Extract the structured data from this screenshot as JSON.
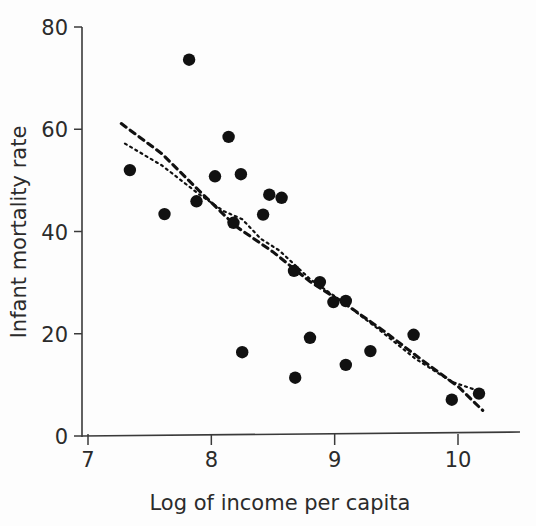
{
  "chart_data": {
    "type": "scatter",
    "title": "",
    "xlabel": "Log of income per capita",
    "ylabel": "Infant mortality rate",
    "xlim": [
      6.85,
      10.35
    ],
    "ylim": [
      0,
      82
    ],
    "xticks": [
      7,
      8,
      9,
      10
    ],
    "xtick_labels": [
      "7",
      "8",
      "9",
      "10"
    ],
    "yticks": [
      0,
      20,
      40,
      60,
      80
    ],
    "ytick_labels": [
      "0",
      "20",
      "40",
      "60",
      "80"
    ],
    "grid": false,
    "legend": "none",
    "points": [
      {
        "x": 7.34,
        "y": 52.0
      },
      {
        "x": 7.62,
        "y": 43.4
      },
      {
        "x": 7.82,
        "y": 73.6
      },
      {
        "x": 7.88,
        "y": 45.9
      },
      {
        "x": 8.03,
        "y": 50.8
      },
      {
        "x": 8.14,
        "y": 58.5
      },
      {
        "x": 8.18,
        "y": 41.7
      },
      {
        "x": 8.24,
        "y": 51.2
      },
      {
        "x": 8.25,
        "y": 16.4
      },
      {
        "x": 8.42,
        "y": 43.3
      },
      {
        "x": 8.47,
        "y": 47.2
      },
      {
        "x": 8.57,
        "y": 46.6
      },
      {
        "x": 8.67,
        "y": 32.3
      },
      {
        "x": 8.68,
        "y": 11.4
      },
      {
        "x": 8.8,
        "y": 19.2
      },
      {
        "x": 8.88,
        "y": 30.1
      },
      {
        "x": 8.99,
        "y": 26.2
      },
      {
        "x": 9.09,
        "y": 26.4
      },
      {
        "x": 9.09,
        "y": 13.9
      },
      {
        "x": 9.29,
        "y": 16.6
      },
      {
        "x": 9.64,
        "y": 19.8
      },
      {
        "x": 9.95,
        "y": 7.1
      },
      {
        "x": 10.17,
        "y": 8.3
      }
    ],
    "series": [
      {
        "name": "dashed-fit",
        "style": "dashed",
        "points": [
          {
            "x": 7.27,
            "y": 61.1
          },
          {
            "x": 7.6,
            "y": 55.2
          },
          {
            "x": 7.9,
            "y": 48.0
          },
          {
            "x": 8.2,
            "y": 41.0
          },
          {
            "x": 8.5,
            "y": 36.0
          },
          {
            "x": 8.8,
            "y": 30.2
          },
          {
            "x": 9.1,
            "y": 25.6
          },
          {
            "x": 9.4,
            "y": 20.5
          },
          {
            "x": 9.7,
            "y": 15.0
          },
          {
            "x": 10.0,
            "y": 9.7
          },
          {
            "x": 10.2,
            "y": 5.0
          }
        ]
      },
      {
        "name": "dotted-fit",
        "style": "dotted",
        "points": [
          {
            "x": 7.3,
            "y": 57.2
          },
          {
            "x": 7.6,
            "y": 52.9
          },
          {
            "x": 7.9,
            "y": 47.3
          },
          {
            "x": 8.1,
            "y": 44.0
          },
          {
            "x": 8.25,
            "y": 42.4
          },
          {
            "x": 8.4,
            "y": 38.6
          },
          {
            "x": 8.55,
            "y": 36.3
          },
          {
            "x": 8.8,
            "y": 30.7
          },
          {
            "x": 9.05,
            "y": 26.5
          },
          {
            "x": 9.35,
            "y": 21.0
          },
          {
            "x": 9.65,
            "y": 15.2
          },
          {
            "x": 9.95,
            "y": 10.6
          },
          {
            "x": 10.22,
            "y": 8.4
          }
        ]
      }
    ]
  },
  "colors": {
    "point": "#111111",
    "axis": "#3a3a3a",
    "text": "#2b2b2b",
    "background": "#fdfdfd"
  }
}
